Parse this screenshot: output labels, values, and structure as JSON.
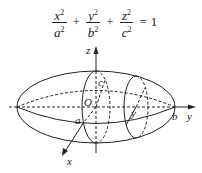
{
  "formula": {
    "terms": [
      {
        "num": "x",
        "den": "a",
        "exp": "2"
      },
      {
        "num": "y",
        "den": "b",
        "exp": "2"
      },
      {
        "num": "z",
        "den": "c",
        "exp": "2"
      }
    ],
    "plus": "+",
    "equals": "=",
    "rhs": "1"
  },
  "labels": {
    "z_axis": "z",
    "y_axis": "y",
    "x_axis": "x",
    "origin": "O",
    "a": "a",
    "b": "b",
    "c": "c",
    "section_y": "y"
  },
  "colors": {
    "stroke": "#222222",
    "background": "#ffffff"
  }
}
